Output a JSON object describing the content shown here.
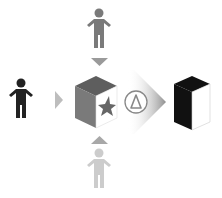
{
  "diagram": {
    "colors": {
      "background": "#ffffff",
      "actor_top": "#7a7a7a",
      "actor_left": "#222222",
      "actor_bottom": "#cccccc",
      "arrow_top": "#9a9a9a",
      "arrow_left": "#bdbdbd",
      "arrow_bottom": "#a8a8a8",
      "cube_top": "#5e5e5e",
      "cube_left": "#7a7a7a",
      "cube_front": "#ffffff",
      "star": "#666666",
      "delta_stroke": "#888888",
      "chevron": "#999999",
      "result_dark": "#111111",
      "result_light": "#ffffff"
    },
    "nodes": [
      {
        "id": "actor-top",
        "icon": "person-icon",
        "shade": "medium-gray"
      },
      {
        "id": "actor-left",
        "icon": "person-icon",
        "shade": "black"
      },
      {
        "id": "actor-bottom",
        "icon": "person-icon",
        "shade": "light-gray"
      },
      {
        "id": "source-cube",
        "icon": "cube-with-star-icon"
      },
      {
        "id": "change-operator",
        "icon": "delta-icon",
        "label": "Δ"
      },
      {
        "id": "result-cube",
        "icon": "black-cube-icon"
      }
    ],
    "edges": [
      {
        "from": "actor-top",
        "to": "source-cube",
        "icon": "arrow-down-icon"
      },
      {
        "from": "actor-left",
        "to": "source-cube",
        "icon": "arrow-right-icon"
      },
      {
        "from": "actor-bottom",
        "to": "source-cube",
        "icon": "arrow-up-icon"
      },
      {
        "from": "source-cube",
        "to": "result-cube",
        "icon": "chevron-right-icon",
        "via": "change-operator"
      }
    ],
    "delta_symbol": "Δ"
  }
}
